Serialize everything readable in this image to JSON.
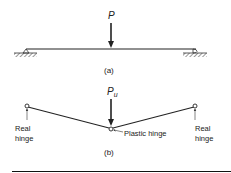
{
  "figure_a": {
    "load_label": "P",
    "caption": "(a)"
  },
  "figure_b": {
    "load_label": "P",
    "load_subscript": "u",
    "caption": "(b)",
    "left_hinge_line1": "Real",
    "left_hinge_line2": "hinge",
    "right_hinge_line1": "Real",
    "right_hinge_line2": "hinge",
    "plastic_hinge_label": "Plastic hinge"
  },
  "colors": {
    "ink": "#222222",
    "background": "#ffffff"
  }
}
